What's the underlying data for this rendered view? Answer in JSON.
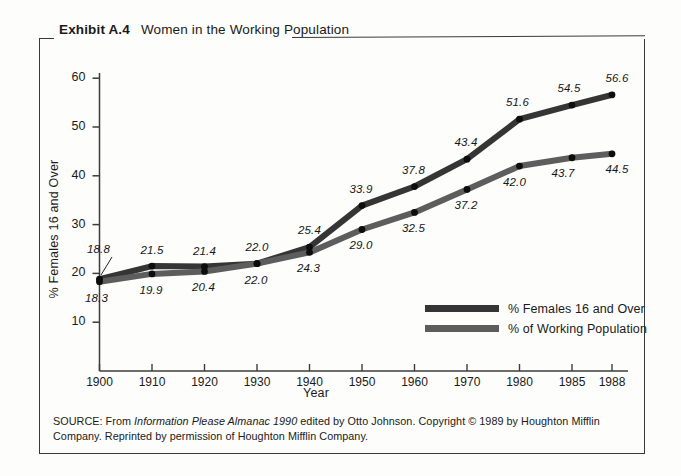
{
  "exhibit": {
    "label": "Exhibit A.4",
    "title": "Women in the Working Population"
  },
  "source_note": {
    "prefix": "SOURCE: From ",
    "italic": "Information Please Almanac 1990",
    "suffix": " edited by Otto Johnson. Copyright © 1989 by Houghton Mifflin Company. Reprinted by permission of Houghton Mifflin Company."
  },
  "chart_data": {
    "type": "line",
    "title": "Women in the Working Population",
    "xlabel": "Year",
    "ylabel": "% Females 16 and Over",
    "categories": [
      "1900",
      "1910",
      "1920",
      "1930",
      "1940",
      "1950",
      "1960",
      "1970",
      "1980",
      "1985",
      "1988"
    ],
    "x": [
      1900,
      1910,
      1920,
      1930,
      1940,
      1950,
      1960,
      1970,
      1980,
      1985,
      1988
    ],
    "ylim": [
      0,
      60
    ],
    "yticks": [
      "10",
      "20",
      "30",
      "40",
      "50",
      "60"
    ],
    "ytick_values": [
      10,
      20,
      30,
      40,
      50,
      60
    ],
    "grid": false,
    "legend_position": "inside-lower-right",
    "series": [
      {
        "name": "% Females 16 and Over",
        "color": "#353535",
        "values": [
          18.8,
          21.5,
          21.4,
          22.0,
          25.4,
          33.9,
          37.8,
          43.4,
          51.6,
          54.5,
          56.6
        ],
        "labels": [
          "18.8",
          "21.5",
          "21.4",
          "22.0",
          "25.4",
          "33.9",
          "37.8",
          "43.4",
          "51.6",
          "54.5",
          "56.6"
        ]
      },
      {
        "name": "% of Working Population",
        "color": "#5d5d5d",
        "values": [
          18.3,
          19.9,
          20.4,
          22.0,
          24.3,
          29.0,
          32.5,
          37.2,
          42.0,
          43.7,
          44.5
        ],
        "labels": [
          "18.3",
          "19.9",
          "20.4",
          "22.0",
          "24.3",
          "29.0",
          "32.5",
          "37.2",
          "42.0",
          "43.7",
          "44.5"
        ]
      }
    ]
  }
}
